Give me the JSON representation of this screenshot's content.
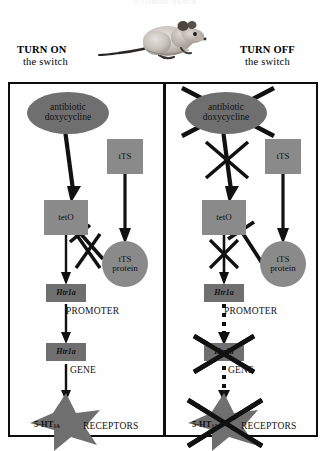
{
  "figure": {
    "title": "A Genetic Switch",
    "mouse_alt": "mouse"
  },
  "headings": {
    "left": {
      "line1": "TURN ON",
      "line2": "the switch"
    },
    "right": {
      "line1": "TURN OFF",
      "line2": "the switch"
    }
  },
  "colors": {
    "ellipse_fill": "#6f6f6f",
    "box_fill": "#8a8a8a",
    "dark_box_fill": "#6f6f6f",
    "stroke": "#111111",
    "frame": "#0d0d0d",
    "background": "#ffffff"
  },
  "left_panel": {
    "nodes": {
      "drug": {
        "line1": "antibiotic",
        "line2": "doxycycline",
        "shape": "ellipse"
      },
      "tts": {
        "label": "tTS",
        "shape": "rect"
      },
      "teto": {
        "label": "tetO",
        "shape": "rect"
      },
      "tts_protein": {
        "line1": "tTS",
        "line2": "protein",
        "shape": "circle"
      },
      "promoter_box": {
        "label": "Htr1a",
        "shape": "rect-dark"
      },
      "gene_box": {
        "label": "Htr1a",
        "shape": "rect-dark"
      },
      "receptor_star": {
        "label": "5-HT",
        "subscript": "1A",
        "shape": "star"
      }
    },
    "side_labels": {
      "promoter": "PROMOTER",
      "gene": "GENE",
      "receptors": "RECEPTORS"
    },
    "arrows": {
      "drug_to_teto": "solid",
      "tts_to_protein": "solid",
      "teto_to_promoter": "solid",
      "promoter_to_gene": "solid",
      "gene_to_receptors": "solid",
      "protein_inhibits_teto": "blocked"
    },
    "crossed_out": []
  },
  "right_panel": {
    "nodes": {
      "drug": {
        "line1": "antibiotic",
        "line2": "doxycycline",
        "shape": "ellipse"
      },
      "tts": {
        "label": "tTS",
        "shape": "rect"
      },
      "teto": {
        "label": "tetO",
        "shape": "rect"
      },
      "tts_protein": {
        "line1": "tTS",
        "line2": "protein",
        "shape": "circle"
      },
      "promoter_box": {
        "label": "Htr1a",
        "shape": "rect-dark"
      },
      "gene_box": {
        "label": "Htr1a",
        "shape": "rect-dark"
      },
      "receptor_star": {
        "label": "5-HT",
        "subscript": "1A",
        "shape": "star"
      }
    },
    "side_labels": {
      "promoter": "PROMOTER",
      "gene": "GENE",
      "receptors": "RECEPTORS"
    },
    "arrows": {
      "drug_to_teto": "solid-blocked",
      "tts_to_protein": "solid",
      "teto_to_promoter": "solid-blocked",
      "promoter_to_gene": "dotted",
      "gene_to_receptors": "dotted",
      "protein_inhibits_teto": "active"
    },
    "crossed_out": [
      "drug",
      "gene_box",
      "receptor_star"
    ]
  }
}
